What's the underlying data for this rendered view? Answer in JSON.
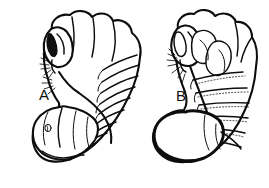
{
  "figure": {
    "caption_present": false,
    "background_color": "#ffffff",
    "ink_color": "#0d0d0d",
    "panel_count": 2,
    "panels": [
      {
        "id": "A",
        "label": "A",
        "label_x": 44,
        "label_y": 100,
        "side": "left",
        "orientation": "c-shaped-curled",
        "head_position": "upper-left",
        "eye_style": "solid-dark",
        "abdomen_style": "light-outlined",
        "segment_count": 11,
        "has_spiracle_mark": true
      },
      {
        "id": "B",
        "label": "B",
        "label_x": 181,
        "label_y": 101,
        "side": "right",
        "orientation": "j-shaped-upright",
        "head_position": "upper-left",
        "eye_style": "open-outlined",
        "abdomen_style": "bold-dark-outline",
        "segment_count": 10,
        "has_spiracle_mark": false
      }
    ]
  }
}
